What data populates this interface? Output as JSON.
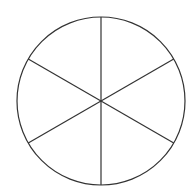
{
  "diagram": {
    "type": "circle-divided-into-sectors",
    "sectors": 6,
    "center": [
      101,
      101
    ],
    "radius": 84,
    "stroke_color": "#333333",
    "fill_color": "#ffffff",
    "spoke_angles_deg": [
      90,
      30,
      -30,
      -90,
      -150,
      150
    ]
  }
}
